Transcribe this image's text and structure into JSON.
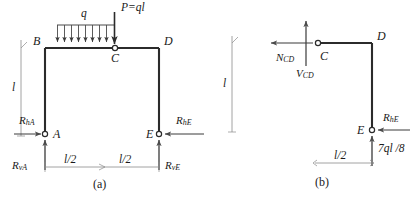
{
  "figure": {
    "title_visible": false,
    "panels": [
      {
        "id": "a",
        "caption": "(a)",
        "nodes": {
          "A": "A",
          "B": "B",
          "C": "C",
          "D": "D",
          "E": "E"
        },
        "loads": {
          "distributed": "q",
          "point": "P=ql"
        },
        "reactions": {
          "horizontal_left": "R",
          "horizontal_left_sub": "hA",
          "horizontal_right": "R",
          "horizontal_right_sub": "hE",
          "vertical_left": "R",
          "vertical_left_sub": "vA",
          "vertical_right": "R",
          "vertical_right_sub": "vE"
        },
        "dimensions": {
          "height": "l",
          "span_left": "l/2",
          "span_right": "l/2"
        }
      },
      {
        "id": "b",
        "caption": "(b)",
        "nodes": {
          "C": "C",
          "D": "D",
          "E": "E"
        },
        "internal_forces": {
          "normal": "N",
          "normal_sub": "CD",
          "shear": "V",
          "shear_sub": "CD"
        },
        "reactions": {
          "horizontal_right": "R",
          "horizontal_right_sub": "hE",
          "vertical_bottom": "7ql /8"
        },
        "dimensions": {
          "height": "l",
          "span": "l/2"
        }
      }
    ]
  },
  "style": {
    "member_color": "#2b2b2b",
    "thin_color": "#8a8a8a",
    "text_color": "#1a1a1a"
  }
}
